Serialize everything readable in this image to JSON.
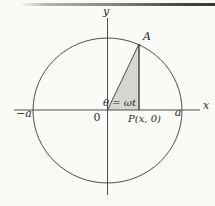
{
  "figure": {
    "labels": {
      "y_axis": "y",
      "x_axis": "x",
      "point_A": "A",
      "x_intercept_negative": "−a",
      "x_intercept_positive": "a",
      "origin": "0",
      "point_P": "P(x, 0)",
      "angle_equation": "θ = ωt"
    },
    "colors": {
      "line": "#3c3b39",
      "triangle_shade": "#d8d6d1",
      "background": "#fbfaf7",
      "top_rule_dark": "#383735",
      "top_rule_light": "#b3b2af"
    }
  }
}
